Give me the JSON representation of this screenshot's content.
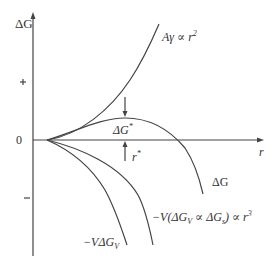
{
  "diagram": {
    "axes": {
      "y_label": "ΔG",
      "x_label": "r",
      "y_ticks": [
        "+",
        "0",
        "–"
      ]
    },
    "curves": [
      {
        "id": "surface",
        "label": "Aγ ∝ r²",
        "label_main": "Aγ ∝ r",
        "label_sup": "2"
      },
      {
        "id": "total",
        "label": "ΔG"
      },
      {
        "id": "volume-combined",
        "label": "−V(ΔG_V ∝ ΔG_s) ∝ r³"
      },
      {
        "id": "volume",
        "label": "−VΔG_V"
      }
    ],
    "annotations": {
      "barrier": "ΔG*",
      "critical_radius": "r*"
    }
  }
}
